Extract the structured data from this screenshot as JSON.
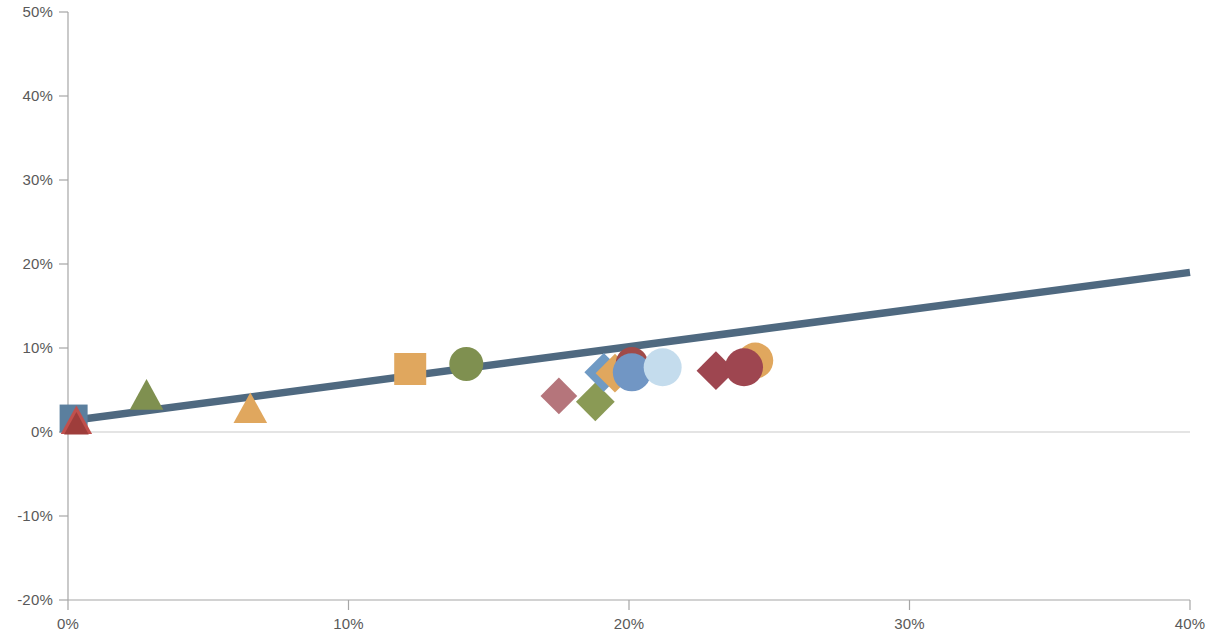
{
  "chart_data": {
    "type": "scatter",
    "title": "",
    "subtitle": "",
    "xlabel": "",
    "ylabel": "",
    "xlim": [
      0,
      40
    ],
    "ylim": [
      -20,
      50
    ],
    "x_tick_labels": [
      "0%",
      "10%",
      "20%",
      "30%",
      "40%"
    ],
    "x_ticks": [
      0,
      10,
      20,
      30,
      40
    ],
    "y_tick_labels": [
      "50%",
      "40%",
      "30%",
      "20%",
      "10%",
      "0%",
      "-10%",
      "-20%"
    ],
    "y_ticks": [
      50,
      40,
      30,
      20,
      10,
      0,
      -10,
      -20
    ],
    "grid": false,
    "legend": "none",
    "zero_line": true,
    "units": "percent",
    "trendline": {
      "name": "linear-trend",
      "color": "#4f6980",
      "width": 7.5,
      "x_start": 0.0,
      "y_start": 1.3,
      "x_end": 40.0,
      "y_end": 19.0
    },
    "points": [
      {
        "label": "origin-square-blue",
        "x": 0.2,
        "y": 1.6,
        "marker": "square",
        "color": "#5b7f9e",
        "size": 28,
        "z": 1
      },
      {
        "label": "origin-triangle-red",
        "x": 0.3,
        "y": 1.3,
        "marker": "triangle",
        "color": "#c0504d",
        "size": 28,
        "z": 2
      },
      {
        "label": "origin-triangle-darkred",
        "x": 0.3,
        "y": 0.9,
        "marker": "triangle",
        "color": "#9e3d3b",
        "size": 22,
        "z": 3
      },
      {
        "label": "triangle-green",
        "x": 2.8,
        "y": 4.3,
        "marker": "triangle",
        "color": "#7f9050",
        "size": 30,
        "z": 4
      },
      {
        "label": "triangle-orange",
        "x": 6.5,
        "y": 2.7,
        "marker": "triangle",
        "color": "#e0a75e",
        "size": 30,
        "z": 5
      },
      {
        "label": "square-orange",
        "x": 12.2,
        "y": 7.5,
        "marker": "square",
        "color": "#e0a75e",
        "size": 32,
        "z": 6
      },
      {
        "label": "circle-green",
        "x": 14.2,
        "y": 8.1,
        "marker": "circle",
        "color": "#7f9050",
        "size": 34,
        "z": 7
      },
      {
        "label": "diamond-rose",
        "x": 17.5,
        "y": 4.3,
        "marker": "diamond",
        "color": "#b5757b",
        "size": 36,
        "z": 8
      },
      {
        "label": "diamond-green",
        "x": 18.8,
        "y": 3.6,
        "marker": "diamond",
        "color": "#8a9a55",
        "size": 38,
        "z": 9
      },
      {
        "label": "diamond-blue",
        "x": 19.1,
        "y": 7.1,
        "marker": "diamond",
        "color": "#6f9ac4",
        "size": 38,
        "z": 10
      },
      {
        "label": "diamond-orange",
        "x": 19.5,
        "y": 7.0,
        "marker": "diamond",
        "color": "#e0a75e",
        "size": 38,
        "z": 11
      },
      {
        "label": "circle-darkred-hidden",
        "x": 20.1,
        "y": 8.2,
        "marker": "circle",
        "color": "#a04a49",
        "size": 32,
        "z": 12
      },
      {
        "label": "circle-blue",
        "x": 20.1,
        "y": 7.1,
        "marker": "circle",
        "color": "#7196c4",
        "size": 38,
        "z": 13
      },
      {
        "label": "circle-lightblue",
        "x": 21.2,
        "y": 7.7,
        "marker": "circle",
        "color": "#c4dced",
        "size": 38,
        "z": 14
      },
      {
        "label": "diamond-darkred",
        "x": 23.1,
        "y": 7.3,
        "marker": "diamond",
        "color": "#9e4650",
        "size": 38,
        "z": 15
      },
      {
        "label": "circle-orange-hidden",
        "x": 24.5,
        "y": 8.5,
        "marker": "circle",
        "color": "#e0a75e",
        "size": 36,
        "z": 16
      },
      {
        "label": "circle-darkred-right",
        "x": 24.1,
        "y": 7.7,
        "marker": "circle",
        "color": "#9e4650",
        "size": 38,
        "z": 17
      }
    ]
  },
  "axes": {
    "x_axis_name": "horizontal-axis",
    "y_axis_name": "vertical-axis"
  },
  "colors": {
    "axis": "#a6a6a6",
    "tick_text": "#595959",
    "zero_line": "#c9c9c9",
    "trendline": "#4f6980",
    "background": "#ffffff"
  }
}
